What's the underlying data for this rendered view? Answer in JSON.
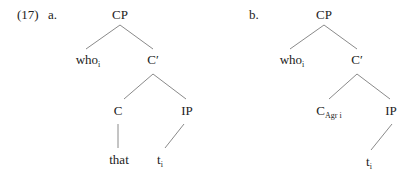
{
  "example_number": "(17)",
  "trees": [
    {
      "label": "a.",
      "nodes": {
        "root": "CP",
        "spec": {
          "base": "who",
          "sub": "i"
        },
        "cbar": "C′",
        "c": "C",
        "ip": "IP",
        "c_leaf": "that",
        "ip_leaf": {
          "base": "t",
          "sub": "i"
        }
      }
    },
    {
      "label": "b.",
      "nodes": {
        "root": "CP",
        "spec": {
          "base": "who",
          "sub": "i"
        },
        "cbar": "C′",
        "c": {
          "base": "C",
          "sub": "Agr i"
        },
        "ip": "IP",
        "ip_leaf": {
          "base": "t",
          "sub": "i"
        }
      }
    }
  ]
}
